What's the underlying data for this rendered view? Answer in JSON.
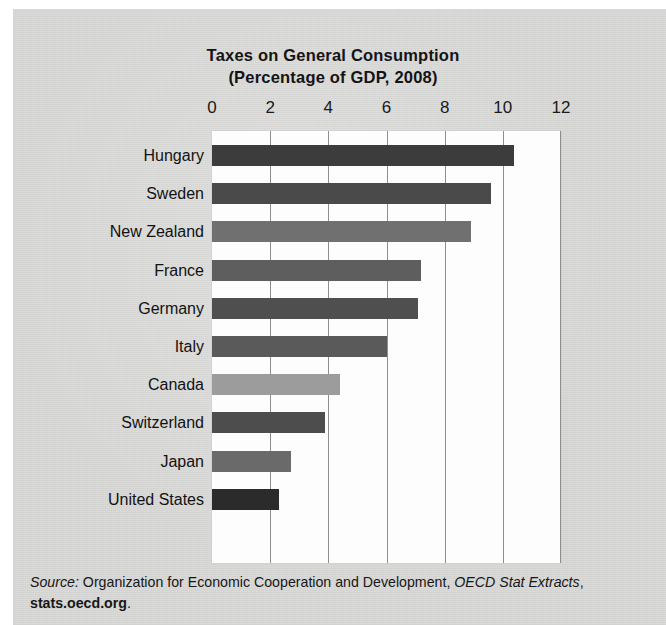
{
  "figure": {
    "title_line1": "Taxes on General Consumption",
    "title_line2": "(Percentage of GDP, 2008)"
  },
  "source_note": {
    "label": "Source:",
    "body": " Organization for Economic Cooperation and Development, ",
    "publication": "OECD Stat Extracts",
    "separator": ", ",
    "url": "stats.oecd.org",
    "period": "."
  },
  "chart_data": {
    "type": "bar",
    "orientation": "horizontal",
    "title": "Taxes on General Consumption (Percentage of GDP, 2008)",
    "xlabel": "",
    "ylabel": "",
    "xlim": [
      0,
      12
    ],
    "xticks": [
      0,
      2,
      4,
      6,
      8,
      10,
      12
    ],
    "xtick_labels": [
      "0",
      "2",
      "4",
      "6",
      "8",
      "10",
      "12"
    ],
    "grid": true,
    "legend": false,
    "categories": [
      "Hungary",
      "Sweden",
      "New Zealand",
      "France",
      "Germany",
      "Italy",
      "Canada",
      "Switzerland",
      "Japan",
      "United States"
    ],
    "values": [
      10.4,
      9.6,
      8.9,
      7.2,
      7.1,
      6.0,
      4.4,
      3.9,
      2.7,
      2.3
    ],
    "bar_colors": [
      "#3c3c3c",
      "#4a4a4a",
      "#707070",
      "#5e5e5e",
      "#4f4f4f",
      "#5a5a5a",
      "#9c9c9c",
      "#4d4d4d",
      "#6a6a6a",
      "#2b2b2b"
    ]
  },
  "colors": {
    "paper": "#d9d9d7",
    "plot_background": "#fdfdfd",
    "gridline": "#8e8e8e",
    "text": "#141414"
  }
}
